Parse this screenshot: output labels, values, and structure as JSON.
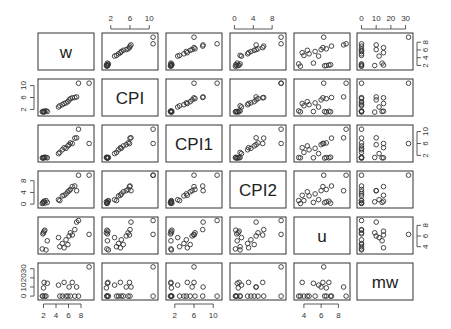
{
  "chart_data": {
    "type": "scatter",
    "subtype": "pairs-matrix",
    "title": "",
    "variables": [
      "w",
      "CPI",
      "CPI1",
      "CPI2",
      "u",
      "mw"
    ],
    "axis_ticks": {
      "w": [
        2,
        4,
        6,
        8
      ],
      "CPI": [
        2,
        6,
        10
      ],
      "CPI1": [
        2,
        6,
        10
      ],
      "CPI2": [
        0,
        4,
        8
      ],
      "u": [
        4,
        6,
        8
      ],
      "mw": [
        0,
        10,
        20,
        30
      ]
    },
    "axis_ranges": {
      "w": [
        1.6,
        9.6
      ],
      "CPI": [
        0.8,
        11.2
      ],
      "CPI1": [
        0.8,
        11.2
      ],
      "CPI2": [
        -0.3,
        10.3
      ],
      "u": [
        3.2,
        9.0
      ],
      "mw": [
        -1,
        33
      ]
    },
    "tick_placement": {
      "top": [
        "CPI",
        "CPI2",
        "mw"
      ],
      "bottom": [
        "w",
        "CPI1",
        "u"
      ],
      "left": [
        "CPI",
        "CPI2",
        "mw"
      ],
      "right": [
        "w",
        "CPI1",
        "u"
      ]
    },
    "observations": {
      "w": [
        1.8,
        1.9,
        2.0,
        2.1,
        2.2,
        2.4,
        2.6,
        4.4,
        4.6,
        5.0,
        5.3,
        5.6,
        5.9,
        6.1,
        6.3,
        6.6,
        7.0,
        7.3,
        7.6,
        9.3
      ],
      "CPI": [
        1.2,
        1.3,
        1.1,
        1.4,
        1.2,
        1.5,
        1.3,
        2.8,
        3.2,
        3.6,
        4.0,
        4.2,
        4.6,
        5.2,
        5.6,
        5.9,
        6.0,
        6.2,
        10.8,
        10.8
      ],
      "CPI1": [
        1.2,
        1.1,
        1.3,
        1.2,
        1.4,
        1.3,
        1.2,
        2.6,
        3.0,
        3.9,
        4.6,
        4.4,
        5.2,
        5.6,
        6.2,
        6.0,
        7.8,
        7.9,
        10.8,
        6.0
      ],
      "CPI2": [
        0.2,
        0.5,
        0.8,
        1.0,
        0.3,
        1.2,
        0.6,
        1.5,
        1.2,
        2.8,
        3.0,
        3.5,
        4.2,
        4.6,
        5.0,
        6.0,
        6.2,
        4.6,
        9.9,
        9.9
      ],
      "u": [
        3.6,
        6.4,
        6.6,
        6.9,
        7.1,
        3.4,
        5.1,
        5.7,
        4.0,
        4.6,
        3.8,
        5.3,
        4.4,
        6.0,
        6.6,
        6.2,
        7.2,
        8.6,
        8.9,
        6.3
      ],
      "mw": [
        0,
        0,
        9,
        15,
        0,
        0,
        14,
        12,
        0,
        0,
        15,
        0,
        0,
        10,
        0,
        15,
        0,
        10,
        0,
        32
      ]
    }
  },
  "diagonal_labels": [
    "w",
    "CPI",
    "CPI1",
    "CPI2",
    "u",
    "mw"
  ]
}
